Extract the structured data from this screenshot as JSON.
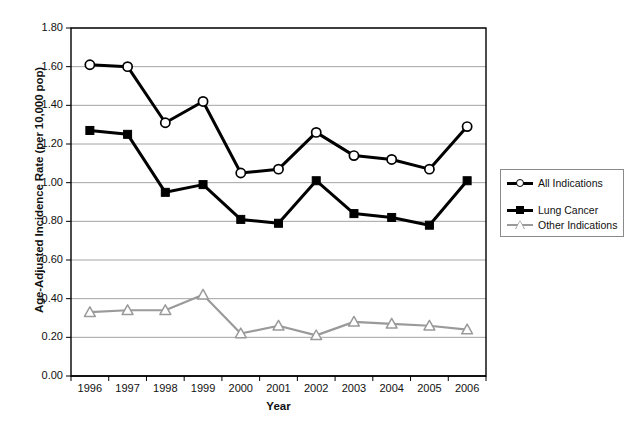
{
  "chart_data": {
    "type": "line",
    "title": "",
    "xlabel": "Year",
    "ylabel": "Age-Adjusted Incidence Rate (per 10,000 pop)",
    "categories": [
      "1996",
      "1997",
      "1998",
      "1999",
      "2000",
      "2001",
      "2002",
      "2003",
      "2004",
      "2005",
      "2006"
    ],
    "x": [
      1996,
      1997,
      1998,
      1999,
      2000,
      2001,
      2002,
      2003,
      2004,
      2005,
      2006
    ],
    "ylim": [
      0.0,
      1.8
    ],
    "ytick_labels": [
      "0.00",
      "0.20",
      "0.40",
      "0.60",
      "0.80",
      "1.00",
      "1.20",
      "1.40",
      "1.60",
      "1.80"
    ],
    "ytick_values": [
      0.0,
      0.2,
      0.4,
      0.6,
      0.8,
      1.0,
      1.2,
      1.4,
      1.6,
      1.8
    ],
    "grid": "horizontal",
    "legend_position": "right",
    "series": [
      {
        "name": "All Indications",
        "marker": "circle-open",
        "color": "#000000",
        "values": [
          1.61,
          1.6,
          1.31,
          1.42,
          1.05,
          1.07,
          1.26,
          1.14,
          1.12,
          1.07,
          1.29
        ]
      },
      {
        "name": "Lung Cancer",
        "marker": "square-filled",
        "color": "#000000",
        "values": [
          1.27,
          1.25,
          0.95,
          0.99,
          0.81,
          0.79,
          1.01,
          0.84,
          0.82,
          0.78,
          1.01
        ]
      },
      {
        "name": "Other Indications",
        "marker": "triangle-open",
        "color": "#9a9a9a",
        "values": [
          0.33,
          0.34,
          0.34,
          0.42,
          0.22,
          0.26,
          0.21,
          0.28,
          0.27,
          0.26,
          0.24
        ]
      }
    ]
  },
  "axes": {
    "x_title": "Year",
    "y_title": "Age-Adjusted Incidence Rate (per 10,000 pop)"
  },
  "legend": {
    "entries": [
      {
        "label": "All Indications"
      },
      {
        "label": "Lung Cancer"
      },
      {
        "label": "Other Indications"
      }
    ]
  },
  "colors": {
    "series_all": "#000000",
    "series_lung": "#000000",
    "series_other": "#9a9a9a",
    "gridline": "#9a9a9a",
    "axis": "#000000",
    "background": "#ffffff"
  }
}
